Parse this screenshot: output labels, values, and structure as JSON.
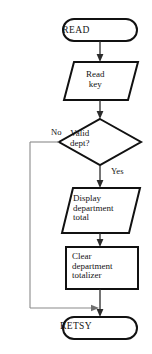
{
  "diagram": {
    "type": "flowchart",
    "background_color": "#ffffff",
    "stroke_color": "#111111",
    "loop_stroke_color": "#8a8a8a",
    "nodes": [
      {
        "id": "start-terminal",
        "shape": "terminal",
        "label": "READ"
      },
      {
        "id": "read-key",
        "shape": "parallelogram",
        "label": "Read\nkey"
      },
      {
        "id": "valid-dept",
        "shape": "diamond",
        "label": "Valid\ndept?"
      },
      {
        "id": "display-total",
        "shape": "parallelogram",
        "label": "Display\ndepartment\ntotal"
      },
      {
        "id": "clear-totalizer",
        "shape": "rectangle",
        "label": "Clear\ndepartment\ntotalizer"
      },
      {
        "id": "end-terminal",
        "shape": "terminal",
        "label": "RETSY"
      }
    ],
    "branch_labels": {
      "no": "No",
      "yes": "Yes"
    }
  }
}
